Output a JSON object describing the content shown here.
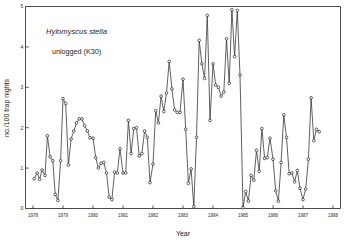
{
  "chart_data": {
    "type": "line",
    "title": "",
    "annotations": [
      {
        "name": "species-label",
        "text": "Hylomyscus stella",
        "style": "italic",
        "x": 1979.45,
        "y": 4.32
      },
      {
        "name": "site-label",
        "text": "unlogged (K30)",
        "style": "normal",
        "x": 1979.45,
        "y": 3.82
      }
    ],
    "xlabel": "Year",
    "ylabel": "no./100 trap nights",
    "xlim": [
      1977.75,
      1988.25
    ],
    "ylim": [
      0,
      5
    ],
    "xticks": [
      1978,
      1979,
      1980,
      1981,
      1982,
      1983,
      1984,
      1985,
      1986,
      1987,
      1988
    ],
    "xtick_labels": [
      "1978",
      "1979",
      "1980",
      "1981",
      "1982",
      "1983",
      "1984",
      "1985",
      "1986",
      "1987",
      "1988"
    ],
    "yticks": [
      0,
      1,
      2,
      3,
      4,
      5
    ],
    "ytick_labels": [
      "0",
      "1",
      "2",
      "3",
      "4",
      "5"
    ],
    "grid": false,
    "legend": "none",
    "marker": "open-circle",
    "line_color": "#2b2b2b",
    "marker_fill": "#ffffff",
    "series": [
      {
        "name": "Hylomyscus stella unlogged (K30)",
        "x": [
          1978.04,
          1978.14,
          1978.22,
          1978.3,
          1978.4,
          1978.48,
          1978.57,
          1978.66,
          1978.74,
          1978.83,
          1978.92,
          1979.0,
          1979.09,
          1979.18,
          1979.27,
          1979.36,
          1979.45,
          1979.54,
          1979.63,
          1979.72,
          1979.81,
          1979.9,
          1980.0,
          1980.09,
          1980.18,
          1980.27,
          1980.36,
          1980.45,
          1980.54,
          1980.63,
          1980.72,
          1980.81,
          1980.9,
          1981.0,
          1981.09,
          1981.18,
          1981.27,
          1981.36,
          1981.45,
          1981.54,
          1981.63,
          1981.72,
          1981.81,
          1981.9,
          1982.0,
          1982.09,
          1982.18,
          1982.27,
          1982.36,
          1982.45,
          1982.54,
          1982.63,
          1982.72,
          1982.81,
          1982.9,
          1983.0,
          1983.09,
          1983.18,
          1983.27,
          1983.36,
          1983.45,
          1983.54,
          1983.63,
          1983.72,
          1983.81,
          1983.9,
          1984.0,
          1984.09,
          1984.18,
          1984.27,
          1984.36,
          1984.45,
          1984.54,
          1984.63,
          1984.72,
          1984.81,
          1984.9,
          1985.0,
          1985.09,
          1985.18,
          1985.27,
          1985.36,
          1985.45,
          1985.54,
          1985.63,
          1985.72,
          1985.81,
          1985.9,
          1986.0,
          1986.09,
          1986.18,
          1986.27,
          1986.36,
          1986.45,
          1986.54,
          1986.63,
          1986.72,
          1986.81,
          1986.9,
          1987.0,
          1987.09,
          1987.18,
          1987.27,
          1987.36,
          1987.45,
          1987.54
        ],
        "values": [
          0.74,
          0.88,
          0.72,
          0.95,
          0.82,
          1.8,
          1.28,
          1.18,
          0.35,
          0.2,
          1.18,
          2.72,
          2.6,
          1.08,
          1.72,
          1.92,
          2.12,
          2.22,
          2.22,
          2.05,
          1.92,
          1.75,
          1.74,
          1.26,
          1.0,
          1.12,
          1.14,
          0.88,
          0.28,
          0.22,
          0.9,
          0.88,
          1.48,
          0.88,
          0.88,
          2.18,
          1.36,
          1.98,
          2.0,
          1.3,
          1.36,
          1.92,
          1.76,
          0.64,
          1.1,
          2.42,
          2.12,
          2.78,
          2.4,
          2.86,
          3.64,
          2.96,
          2.44,
          2.38,
          2.38,
          3.2,
          1.96,
          0.62,
          0.98,
          0.05,
          1.76,
          4.16,
          3.58,
          3.22,
          4.78,
          2.18,
          3.58,
          3.06,
          3.0,
          2.78,
          2.88,
          4.2,
          3.1,
          4.92,
          3.76,
          4.9,
          3.3,
          0.02,
          0.42,
          0.18,
          0.82,
          0.7,
          1.44,
          0.92,
          1.98,
          1.24,
          1.26,
          1.74,
          1.22,
          0.44,
          0.18,
          1.14,
          2.32,
          1.76,
          0.86,
          0.88,
          0.66,
          0.94,
          0.5,
          0.22,
          0.48,
          1.22,
          2.74,
          1.68,
          1.96,
          1.9
        ]
      }
    ]
  }
}
